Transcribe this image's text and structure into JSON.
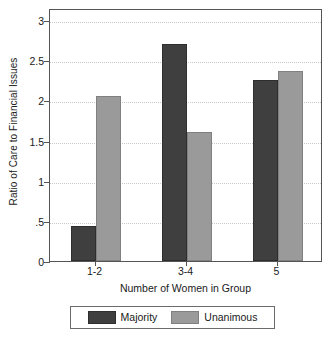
{
  "chart_data": {
    "type": "bar",
    "title": "",
    "xlabel": "Number of Women in Group",
    "ylabel": "Ratio of Care to Financial Issues",
    "categories": [
      "1-2",
      "3-4",
      "5"
    ],
    "series": [
      {
        "name": "Majority",
        "color": "#3f3f3f",
        "values": [
          0.44,
          2.7,
          2.25
        ]
      },
      {
        "name": "Unanimous",
        "color": "#9a9a9a",
        "values": [
          2.05,
          1.61,
          2.36
        ]
      }
    ],
    "ylim": [
      0,
      3.15
    ],
    "yticks": [
      0,
      0.5,
      1,
      1.5,
      2,
      2.5,
      3
    ],
    "ytick_labels": [
      "0",
      ".5",
      "1",
      "1.5",
      "2",
      "2.5",
      "3"
    ],
    "grid": "horizontal-dotted",
    "legend_position": "below-plot",
    "frame": true
  },
  "legend": {
    "entries": [
      {
        "label": "Majority",
        "swatch": "majority-swatch"
      },
      {
        "label": "Unanimous",
        "swatch": "unanimous-swatch"
      }
    ]
  }
}
